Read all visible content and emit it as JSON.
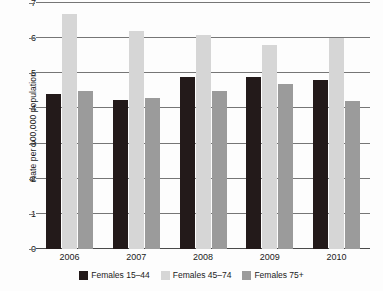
{
  "chart_data": {
    "type": "bar",
    "title": "",
    "xlabel": "",
    "ylabel": "Rate per 100,000 population",
    "categories": [
      "2006",
      "2007",
      "2008",
      "2009",
      "2010"
    ],
    "series": [
      {
        "name": "Females 15–44",
        "color": "#231a1a",
        "values": [
          4.4,
          4.25,
          4.9,
          4.9,
          4.8
        ]
      },
      {
        "name": "Females 45–74",
        "color": "#d6d6d6",
        "values": [
          6.7,
          6.2,
          6.1,
          5.8,
          6.0
        ]
      },
      {
        "name": "Females 75+",
        "color": "#9b9b9b",
        "values": [
          4.5,
          4.3,
          4.5,
          4.7,
          4.2
        ]
      }
    ],
    "ylim": [
      0,
      7
    ],
    "yticks": [
      "0",
      "1",
      "2",
      "3",
      "4",
      "5",
      "6",
      "7"
    ],
    "grid": true,
    "legend_position": "bottom"
  },
  "legend": {
    "items": [
      {
        "label": "Females 15–44"
      },
      {
        "label": "Females 45–74"
      },
      {
        "label": "Females 75+"
      }
    ]
  },
  "axes": {
    "y_title": "Rate per 100,000 population",
    "y_tick_labels": [
      "7",
      "6",
      "5",
      "4",
      "3",
      "2",
      "1",
      "0"
    ],
    "x_tick_labels": [
      "2006",
      "2007",
      "2008",
      "2009",
      "2010"
    ]
  }
}
